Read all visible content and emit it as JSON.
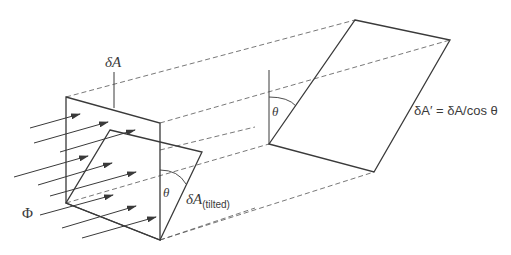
{
  "diagram": {
    "labels": {
      "delta_a": "δA",
      "delta_a_tilted_main": "δA",
      "delta_a_tilted_sub": "(tilted)",
      "theta_left": "θ",
      "theta_right": "θ",
      "flux": "Φ",
      "relation": "δA′ = δA/cos θ"
    },
    "colors": {
      "line": "#3a3a3a",
      "dashed": "#555555",
      "background": "#ffffff"
    },
    "shapes": {
      "upright_square": [
        [
          66,
          97
        ],
        [
          160,
          123
        ],
        [
          160,
          240
        ],
        [
          66,
          203
        ]
      ],
      "tilted_square": [
        [
          110,
          130
        ],
        [
          202,
          152
        ],
        [
          160,
          240
        ],
        [
          66,
          203
        ]
      ],
      "projected_parallelogram": [
        [
          355,
          20
        ],
        [
          450,
          40
        ],
        [
          374,
          172
        ],
        [
          269,
          144
        ]
      ]
    }
  }
}
